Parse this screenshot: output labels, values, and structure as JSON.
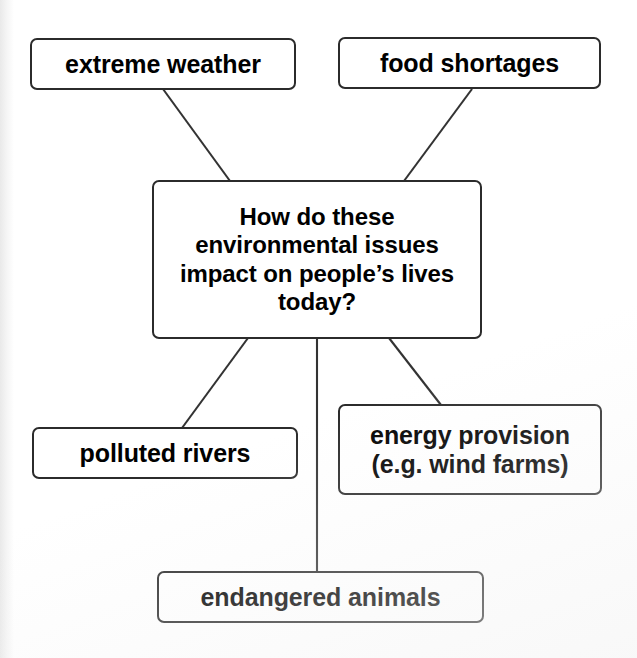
{
  "diagram": {
    "type": "mind-map",
    "central_node": {
      "id": "central",
      "label": "How do these\nenvironmental issues\nimpact on people’s lives\ntoday?",
      "text_lines": [
        "How do these",
        "environmental issues",
        "impact on people’s lives",
        "today?"
      ]
    },
    "nodes": [
      {
        "id": "extreme-weather",
        "label": "extreme weather"
      },
      {
        "id": "food-shortages",
        "label": "food shortages"
      },
      {
        "id": "polluted-rivers",
        "label": "polluted rivers"
      },
      {
        "id": "energy-provision",
        "label": "energy provision\n(e.g. wind farms)"
      },
      {
        "id": "endangered-animals",
        "label": "endangered animals"
      }
    ],
    "connectors": [
      {
        "from": "extreme-weather",
        "to": "central",
        "x1": 163,
        "y1": 89,
        "x2": 230,
        "y2": 181
      },
      {
        "from": "food-shortages",
        "to": "central",
        "x1": 472,
        "y1": 89,
        "x2": 404,
        "y2": 181
      },
      {
        "from": "central",
        "to": "polluted-rivers",
        "x1": 248,
        "y1": 338,
        "x2": 182,
        "y2": 428
      },
      {
        "from": "central",
        "to": "energy-provision",
        "x1": 389,
        "y1": 338,
        "x2": 441,
        "y2": 405
      },
      {
        "from": "central",
        "to": "endangered-animals",
        "x1": 317,
        "y1": 338,
        "x2": 317,
        "y2": 572
      }
    ],
    "colors": {
      "background": "#ffffff",
      "box_fill": "#ffffff",
      "box_stroke": "#2b2b2b",
      "connector_stroke": "#333333",
      "text": "#000000"
    }
  }
}
